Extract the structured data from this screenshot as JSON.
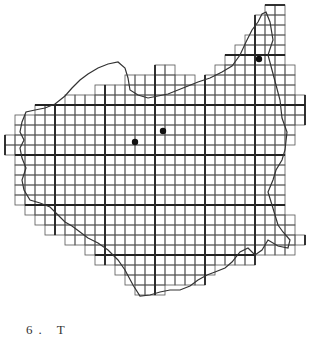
{
  "figure": {
    "caption": "6. T",
    "grid": {
      "origin_x": 5,
      "origin_y": 5,
      "cell": 10,
      "major_every": 5,
      "line_color": "#555555",
      "major_color": "#222222",
      "rows": [
        {
          "r": 0,
          "from": 26,
          "to": 27
        },
        {
          "r": 1,
          "from": 25,
          "to": 27
        },
        {
          "r": 2,
          "from": 25,
          "to": 27
        },
        {
          "r": 3,
          "from": 24,
          "to": 27
        },
        {
          "r": 4,
          "from": 23,
          "to": 27
        },
        {
          "r": 5,
          "from": 22,
          "to": 27
        },
        {
          "r": 6,
          "from": 15,
          "to": 16
        },
        {
          "r": 6,
          "from": 21,
          "to": 28
        },
        {
          "r": 7,
          "from": 12,
          "to": 18
        },
        {
          "r": 7,
          "from": 20,
          "to": 28
        },
        {
          "r": 8,
          "from": 9,
          "to": 28
        },
        {
          "r": 9,
          "from": 6,
          "to": 29
        },
        {
          "r": 10,
          "from": 3,
          "to": 29
        },
        {
          "r": 11,
          "from": 1,
          "to": 29
        },
        {
          "r": 12,
          "from": 1,
          "to": 28
        },
        {
          "r": 13,
          "from": 0,
          "to": 28
        },
        {
          "r": 14,
          "from": 0,
          "to": 27
        },
        {
          "r": 15,
          "from": 1,
          "to": 27
        },
        {
          "r": 16,
          "from": 1,
          "to": 27
        },
        {
          "r": 17,
          "from": 1,
          "to": 27
        },
        {
          "r": 18,
          "from": 1,
          "to": 27
        },
        {
          "r": 19,
          "from": 1,
          "to": 27
        },
        {
          "r": 20,
          "from": 2,
          "to": 27
        },
        {
          "r": 21,
          "from": 3,
          "to": 28
        },
        {
          "r": 22,
          "from": 4,
          "to": 28
        },
        {
          "r": 23,
          "from": 6,
          "to": 29
        },
        {
          "r": 24,
          "from": 8,
          "to": 28
        },
        {
          "r": 25,
          "from": 9,
          "to": 24
        },
        {
          "r": 26,
          "from": 11,
          "to": 20
        },
        {
          "r": 27,
          "from": 12,
          "to": 19
        },
        {
          "r": 28,
          "from": 13,
          "to": 15
        }
      ]
    },
    "dots": [
      {
        "x": 259,
        "y": 59
      },
      {
        "x": 163,
        "y": 131
      },
      {
        "x": 135,
        "y": 142
      }
    ],
    "outline_color": "#333333"
  }
}
